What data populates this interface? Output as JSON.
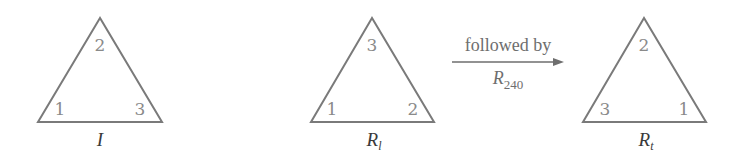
{
  "diagram": {
    "colors": {
      "stroke": "#7a7a7a",
      "vertex_number": "#8a8a8a",
      "caption": "#3a3a3a",
      "arrow": "#6e6e6e"
    },
    "triangles": [
      {
        "caption_main": "I",
        "caption_sub": "",
        "vertices": {
          "top": "2",
          "bottom_left": "1",
          "bottom_right": "3"
        }
      },
      {
        "caption_main": "R",
        "caption_sub": "l",
        "vertices": {
          "top": "3",
          "bottom_left": "1",
          "bottom_right": "2"
        }
      },
      {
        "caption_main": "R",
        "caption_sub": "t",
        "vertices": {
          "top": "2",
          "bottom_left": "3",
          "bottom_right": "1"
        }
      }
    ],
    "arrow": {
      "label_above": "followed by",
      "label_below_main": "R",
      "label_below_sub": "240",
      "icon": "right-arrow-icon"
    }
  }
}
